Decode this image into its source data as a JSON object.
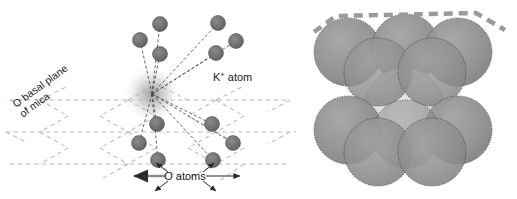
{
  "figure": {
    "panels": [
      "ball-and-stick-coordination",
      "space-filling-model"
    ]
  },
  "colors": {
    "atom_fill": "#6e6e6e",
    "atom_stroke": "#555555",
    "lattice_dash": "#b9b9b9",
    "bond_dash": "#4a4a4a",
    "sphere_gray": "#8f8f8f",
    "sphere_light": "#d6d6d6",
    "sphere_outline": "#3b3b3b",
    "top_edge_dash": "#9a9a9a",
    "text": "#1a1a1a",
    "background": "#ffffff"
  },
  "labels": {
    "k_atom": "K",
    "k_atom_charge": "+",
    "k_atom_suffix": " atom",
    "basal_plane_line1": "O basal plane",
    "basal_plane_line2": "of mica",
    "o_atoms": "O atoms"
  },
  "left_panel": {
    "center": {
      "x": 152,
      "y": 94,
      "name": "potassium-ion-center"
    },
    "upper_atoms": [
      {
        "x": 160,
        "y": 24,
        "r": 7.5
      },
      {
        "x": 218,
        "y": 23,
        "r": 7.5
      },
      {
        "x": 140,
        "y": 40,
        "r": 7.5
      },
      {
        "x": 236,
        "y": 41,
        "r": 7.5
      },
      {
        "x": 160,
        "y": 54,
        "r": 7.5
      },
      {
        "x": 216,
        "y": 53,
        "r": 7.5
      }
    ],
    "lower_atoms": [
      {
        "x": 157,
        "y": 124,
        "r": 7.5
      },
      {
        "x": 212,
        "y": 124,
        "r": 7.5
      },
      {
        "x": 139,
        "y": 143,
        "r": 7.5
      },
      {
        "x": 233,
        "y": 143,
        "r": 7.5
      },
      {
        "x": 158,
        "y": 160,
        "r": 7.5
      },
      {
        "x": 213,
        "y": 160,
        "r": 7.5
      }
    ],
    "lattice_rows": [
      100,
      132,
      164
    ],
    "arrow_label_y": 176
  },
  "right_panel": {
    "gray_spheres": [
      {
        "x": 48,
        "y": 52,
        "r": 34
      },
      {
        "x": 106,
        "y": 48,
        "r": 34
      },
      {
        "x": 158,
        "y": 52,
        "r": 34
      },
      {
        "x": 78,
        "y": 72,
        "r": 34
      },
      {
        "x": 132,
        "y": 72,
        "r": 34
      },
      {
        "x": 48,
        "y": 130,
        "r": 34
      },
      {
        "x": 106,
        "y": 134,
        "r": 34
      },
      {
        "x": 158,
        "y": 130,
        "r": 34
      },
      {
        "x": 78,
        "y": 152,
        "r": 34
      },
      {
        "x": 132,
        "y": 152,
        "r": 34
      }
    ],
    "light_sphere": {
      "x": 104,
      "y": 108,
      "r": 40
    },
    "top_edge": "thick dashed gray line across the top of the model"
  }
}
